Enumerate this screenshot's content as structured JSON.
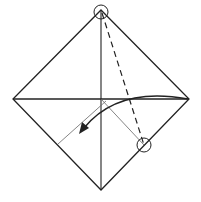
{
  "diagram": {
    "title": "",
    "type": "origami-fold-step",
    "colors": {
      "background": "#ffffff",
      "line": "#222222",
      "thin_line": "#555555"
    },
    "shapes": {
      "square": {
        "top": [
          101,
          10
        ],
        "right": [
          189,
          99
        ],
        "bottom": [
          101,
          190
        ],
        "left": [
          13,
          99
        ]
      },
      "center": [
        101,
        99
      ],
      "circle_top": {
        "cx": 101,
        "cy": 12,
        "r": 7
      },
      "circle_bottom_right": {
        "cx": 144,
        "cy": 145,
        "r": 7
      },
      "dashed_fold_line": {
        "from": [
          101,
          12
        ],
        "to": [
          144,
          145
        ]
      },
      "thin_lines": [
        {
          "from": [
            101,
            99
          ],
          "to": [
            144,
            145
          ]
        },
        {
          "from": [
            106,
            101
          ],
          "to": [
            58,
            144
          ]
        }
      ],
      "arrow": {
        "from": [
          188,
          99
        ],
        "to": [
          80,
          133
        ]
      }
    }
  }
}
